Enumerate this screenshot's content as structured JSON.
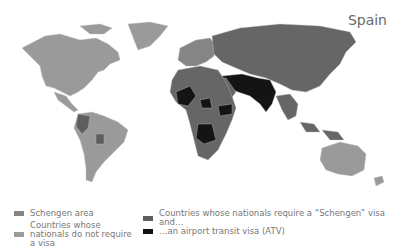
{
  "map": {
    "title": "Spain",
    "colors": {
      "schengen": "#8a8a8a",
      "no_visa": "#9a9a9a",
      "schengen_visa": "#666666",
      "atv": "#141414",
      "border": "#b5b5b5",
      "background": "#ffffff"
    }
  },
  "legend": {
    "items": [
      {
        "label": "Schengen area",
        "color": "#858585"
      },
      {
        "label": "Countries whose nationals do not require a visa",
        "color": "#9c9c9c"
      },
      {
        "label": "Countries whose nationals require a “Schengen” visa and…",
        "color": "#5e5e5e"
      },
      {
        "label": "…an airport transit visa (ATV)",
        "color": "#111111"
      }
    ]
  }
}
